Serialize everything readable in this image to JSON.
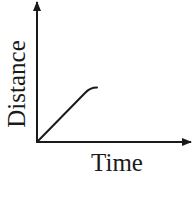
{
  "chart_data": {
    "type": "line",
    "title": "",
    "xlabel": "Time",
    "ylabel": "Distance",
    "grid": false,
    "legend": null,
    "axis_ticks": "none",
    "x": [
      0,
      0.32,
      0.4
    ],
    "series": [
      {
        "name": "distance-vs-time",
        "description": "Straight line from origin with constant slope, then slightly leveling off at the end",
        "values": [
          0,
          0.35,
          0.39
        ]
      }
    ],
    "xlim": [
      0,
      1
    ],
    "ylim": [
      0,
      1
    ]
  },
  "colors": {
    "line": "#1a1a1a",
    "axis": "#1a1a1a",
    "background": "#ffffff"
  }
}
